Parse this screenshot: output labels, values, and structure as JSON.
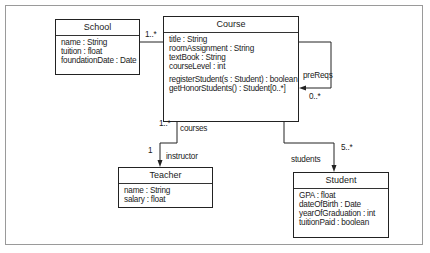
{
  "diagram": {
    "type": "UML class diagram",
    "classes": {
      "school": {
        "name": "School",
        "attributes": [
          "name : String",
          "tuition : float",
          "foundationDate : Date"
        ]
      },
      "course": {
        "name": "Course",
        "attributes": [
          "title : String",
          "roomAssignment : String",
          "textBook : String",
          "courseLevel : int"
        ],
        "operations": [
          "registerStudent(s : Student) : boolean",
          "getHonorStudents() : Student[0..*]"
        ]
      },
      "teacher": {
        "name": "Teacher",
        "attributes": [
          "name : String",
          "salary : float"
        ]
      },
      "student": {
        "name": "Student",
        "attributes": [
          "GPA : float",
          "dateOfBirth : Date",
          "yearOfGraduation : int",
          "tuitionPaid : boolean"
        ]
      }
    },
    "associations": {
      "school_course": {
        "multiplicity": "1..*"
      },
      "prereqs": {
        "role": "preReqs",
        "multiplicity": "0..*"
      },
      "course_teacher": {
        "source_multiplicity": "1..*",
        "source_role": "courses",
        "target_multiplicity": "1",
        "target_role": "instructor"
      },
      "course_student": {
        "role": "students",
        "multiplicity": "5..*"
      }
    }
  }
}
